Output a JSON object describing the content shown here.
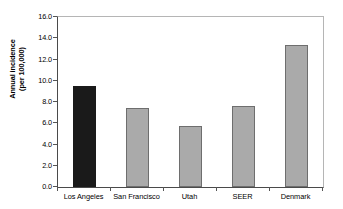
{
  "chart_data": {
    "type": "bar",
    "title": "",
    "subtitle": "",
    "xlabel": "",
    "ylabel_line1": "Annual incidence",
    "ylabel_line2": "(per 100,000)",
    "categories": [
      "Los Angeles",
      "San Francisco",
      "Utah",
      "SEER",
      "Denmark"
    ],
    "values": [
      9.5,
      7.4,
      5.75,
      7.6,
      13.4
    ],
    "bar_colors": [
      "#1a1a1a",
      "#aaaaaa",
      "#aaaaaa",
      "#aaaaaa",
      "#aaaaaa"
    ],
    "bar_border_colors": [
      "#1a1a1a",
      "#6e6e6e",
      "#6e6e6e",
      "#6e6e6e",
      "#6e6e6e"
    ],
    "ylim": [
      0.0,
      16.0
    ],
    "ytick_values": [
      0.0,
      2.0,
      4.0,
      6.0,
      8.0,
      10.0,
      12.0,
      14.0,
      16.0
    ],
    "ytick_labels": [
      "0.0",
      "2.0",
      "4.0",
      "6.0",
      "8.0",
      "10.0",
      "12.0",
      "14.0",
      "16.0"
    ],
    "grid": false,
    "legend": false,
    "legend_position": "none",
    "axis_color": "#4a4a4a",
    "background_color": "#ffffff"
  }
}
